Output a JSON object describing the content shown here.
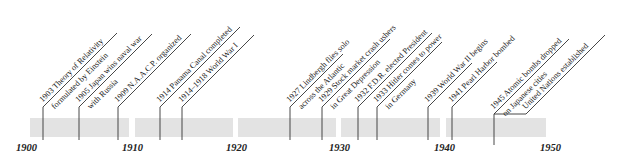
{
  "timeline": {
    "segments": [
      {
        "left": 30,
        "width": 99
      },
      {
        "left": 135,
        "width": 98
      },
      {
        "left": 238,
        "width": 98
      },
      {
        "left": 341,
        "width": 99
      },
      {
        "left": 446,
        "width": 100
      }
    ],
    "decades": [
      {
        "label": "1900",
        "x": 16
      },
      {
        "label": "1910",
        "x": 122
      },
      {
        "label": "1920",
        "x": 226
      },
      {
        "label": "1930",
        "x": 329
      },
      {
        "label": "1940",
        "x": 434
      },
      {
        "label": "1950",
        "x": 540
      }
    ],
    "events": [
      {
        "id": "e1903",
        "x": 43,
        "lines": [
          "1903 Theory of Relativity",
          "formulated by Einstein"
        ]
      },
      {
        "id": "e1905",
        "x": 79,
        "lines": [
          "1905 Japan wins naval war",
          "with Russia"
        ]
      },
      {
        "id": "e1909",
        "x": 118,
        "lines": [
          "1909 N.A.A.C.P. organized"
        ]
      },
      {
        "id": "e1914",
        "x": 160,
        "lines": [
          "1914 Panama Canal completed"
        ]
      },
      {
        "id": "e1918",
        "x": 182,
        "lines": [
          "1914–1918 World War I"
        ]
      },
      {
        "id": "e1927",
        "x": 290,
        "lines": [
          "1927 Lindbergh flies solo",
          "across the Atlantic"
        ]
      },
      {
        "id": "e1929",
        "x": 322,
        "lines": [
          "1929 Stock market crash ushers",
          "in Great Depression"
        ]
      },
      {
        "id": "e1932",
        "x": 358,
        "lines": [
          "1932 F.D.R. elected President"
        ]
      },
      {
        "id": "e1933",
        "x": 377,
        "lines": [
          "1933 Hitler comes to power",
          "in Germany"
        ]
      },
      {
        "id": "e1939",
        "x": 428,
        "lines": [
          "1939 World War II begins"
        ]
      },
      {
        "id": "e1941",
        "x": 452,
        "lines": [
          "1941 Pearl Harbor bombed"
        ]
      },
      {
        "id": "e1945",
        "x": 494,
        "lines": [
          "1945 Atomic bombs dropped",
          "on Japanese cities"
        ]
      },
      {
        "id": "e1945b",
        "x": 526,
        "lines": [
          "United Nations established"
        ]
      }
    ]
  },
  "labels": {
    "e1903_0": "1903 Theory of Relativity",
    "e1903_1": "formulated by Einstein",
    "e1905_0": "1905 Japan wins naval war",
    "e1905_1": "with Russia",
    "e1909_0": "1909 N.A.A.C.P. organized",
    "e1914_0": "1914 Panama Canal completed",
    "e1918_0": "1914–1918 World War I",
    "e1927_0": "1927 Lindbergh flies solo",
    "e1927_1": "across the Atlantic",
    "e1929_0": "1929 Stock market crash ushers",
    "e1929_1": "in Great Depression",
    "e1932_0": "1932 F.D.R. elected President",
    "e1933_0": "1933 Hitler comes to power",
    "e1933_1": "in Germany",
    "e1939_0": "1939 World War II begins",
    "e1941_0": "1941 Pearl Harbor bombed",
    "e1945_0": "1945 Atomic bombs dropped",
    "e1945_1": "on Japanese cities",
    "e1945b_0": "United Nations established"
  },
  "years": {
    "y1900": "1900",
    "y1910": "1910",
    "y1920": "1920",
    "y1930": "1930",
    "y1940": "1940",
    "y1950": "1950"
  }
}
